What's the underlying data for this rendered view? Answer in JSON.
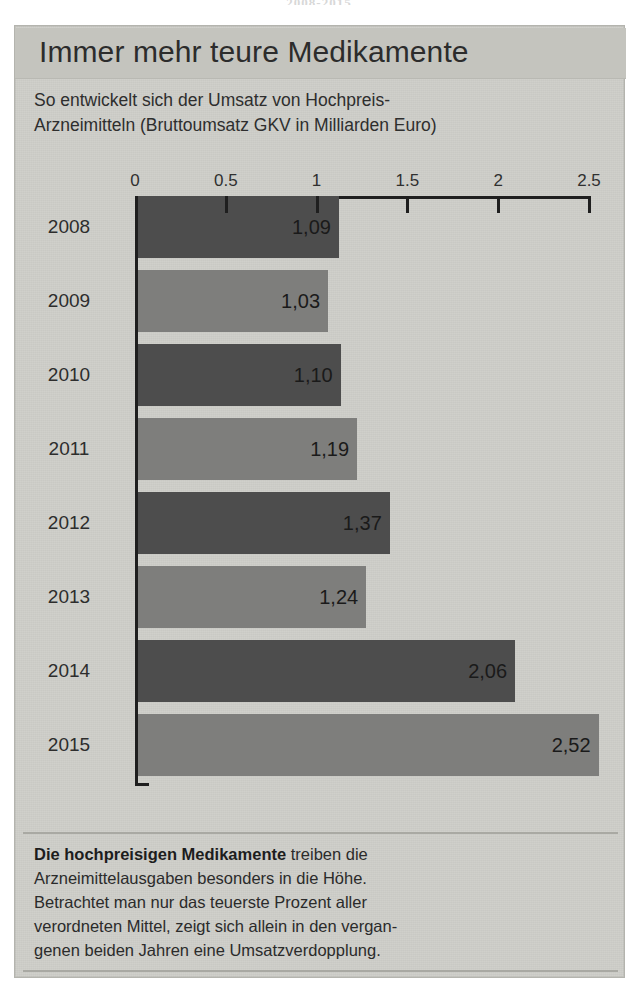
{
  "clipped_caption": "2008-2015",
  "panel": {
    "title": "Immer mehr teure Medikamente",
    "subtitle_lines": [
      "So entwickelt sich der Umsatz von Hochpreis-",
      "Arzneimitteln (Bruttoumsatz GKV in Milliarden Euro)"
    ],
    "footnote_lead": "Die hochpreisigen Medikamente",
    "footnote_lines": [
      " treiben die",
      "Arzneimittelausgaben besonders in die Höhe.",
      "Betrachtet man nur das teuerste Prozent aller",
      "verordneten Mittel, zeigt sich allein in den vergan-",
      "genen beiden Jahren eine Umsatzverdopplung."
    ]
  },
  "colors": {
    "panel_background": "#cfcfca",
    "title_band": "#c4c4be",
    "bar_dark": "#4d4d4d",
    "bar_light": "#7e7e7c",
    "axis": "#1f1f1f",
    "text": "#2c2c2c"
  },
  "chart_data": {
    "type": "bar",
    "orientation": "horizontal",
    "title": "Immer mehr teure Medikamente",
    "subtitle": "So entwickelt sich der Umsatz von Hochpreis-Arzneimitteln (Bruttoumsatz GKV in Milliarden Euro)",
    "xlabel": "Bruttoumsatz GKV in Milliarden Euro",
    "ylabel": "",
    "xlim": [
      0,
      2.5
    ],
    "grid": false,
    "legend": "none",
    "xticks": [
      0,
      0.5,
      1,
      1.5,
      2,
      2.5
    ],
    "xtick_labels": [
      "0",
      "0.5",
      "1",
      "1.5",
      "2",
      "2.5"
    ],
    "categories": [
      "2008",
      "2009",
      "2010",
      "2011",
      "2012",
      "2013",
      "2014",
      "2015"
    ],
    "values": [
      1.09,
      1.03,
      1.1,
      1.19,
      1.37,
      1.24,
      2.06,
      2.52
    ],
    "value_labels": [
      "1,09",
      "1,03",
      "1,10",
      "1,19",
      "1,37",
      "1,24",
      "2,06",
      "2,52"
    ],
    "bar_styles": [
      "dark",
      "light",
      "dark",
      "light",
      "dark",
      "light",
      "dark",
      "light"
    ]
  }
}
